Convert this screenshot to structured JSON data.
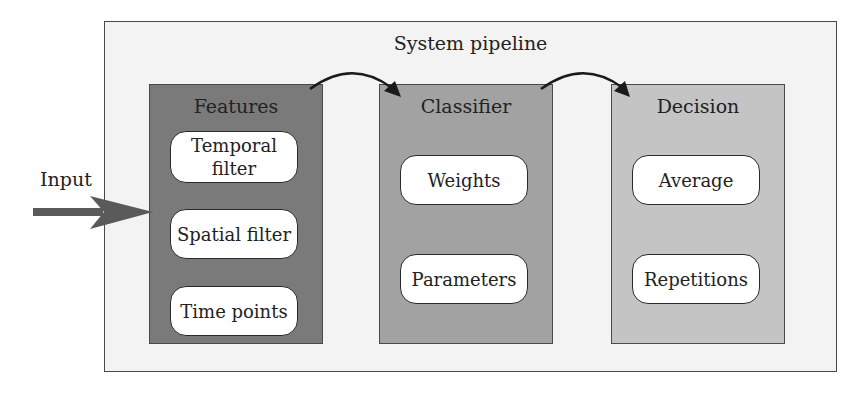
{
  "diagram": {
    "title": "System pipeline",
    "input_label": "Input",
    "colors": {
      "outer_fill": "#f3f3f3",
      "features_fill": "#7a7a7a",
      "classifier_fill": "#a2a2a2",
      "decision_fill": "#c4c4c4",
      "pill_fill": "#ffffff",
      "arrow": "#5a5a5a",
      "border": "#4a4a4a"
    },
    "stages": [
      {
        "title": "Features",
        "items": [
          "Temporal filter",
          "Spatial filter",
          "Time points"
        ]
      },
      {
        "title": "Classifier",
        "items": [
          "Weights",
          "Parameters"
        ]
      },
      {
        "title": "Decision",
        "items": [
          "Average",
          "Repetitions"
        ]
      }
    ],
    "connections": [
      {
        "from": "Input",
        "to": "Features"
      },
      {
        "from": "Features",
        "to": "Classifier"
      },
      {
        "from": "Classifier",
        "to": "Decision"
      }
    ]
  }
}
